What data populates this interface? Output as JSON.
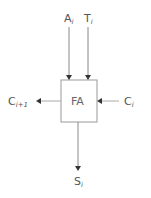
{
  "diagram": {
    "type": "full-adder-block",
    "block": {
      "label": "FA"
    },
    "inputs": [
      {
        "id": "a",
        "base": "A",
        "sub": "i",
        "direction": "top"
      },
      {
        "id": "t",
        "base": "T",
        "sub": "i",
        "direction": "top"
      },
      {
        "id": "c_in",
        "base": "C",
        "sub": "i",
        "direction": "right"
      }
    ],
    "outputs": [
      {
        "id": "c_out",
        "base": "C",
        "sub": "i+1",
        "direction": "left"
      },
      {
        "id": "s",
        "base": "S",
        "sub": "i",
        "direction": "bottom"
      }
    ],
    "colors": {
      "stroke": "#888888",
      "text": "#555555",
      "arrowhead": "#333333"
    }
  }
}
